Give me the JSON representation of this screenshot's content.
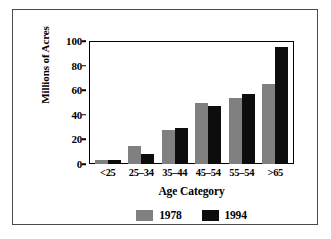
{
  "chart_data": {
    "type": "bar",
    "title": "",
    "xlabel": "Age Category",
    "ylabel": "Millions of Acres",
    "categories": [
      "<25",
      "25–34",
      "35–44",
      "45–54",
      "55–54",
      ">65"
    ],
    "series": [
      {
        "name": "1978",
        "color": "#808080",
        "values": [
          3,
          15,
          28,
          50,
          54,
          65
        ]
      },
      {
        "name": "1994",
        "color": "#0d0d0d",
        "values": [
          3,
          8,
          29,
          47,
          57,
          95
        ]
      }
    ],
    "ylim": [
      0,
      100
    ],
    "yticks": [
      0,
      20,
      40,
      60,
      80,
      100
    ],
    "ytick_labels": [
      "0",
      "20",
      "40",
      "60",
      "80",
      "100"
    ],
    "grid": false,
    "legend_position": "bottom"
  },
  "legend": {
    "entries": [
      {
        "label": "1978",
        "color": "#808080"
      },
      {
        "label": "1994",
        "color": "#0d0d0d"
      }
    ]
  },
  "colors": {
    "series_1978": "#808080",
    "series_1994": "#0d0d0d",
    "axis": "#000000",
    "frame": "#4a4a4a",
    "background": "#ffffff"
  }
}
